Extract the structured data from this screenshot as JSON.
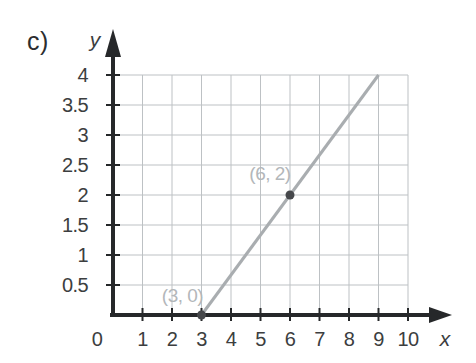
{
  "figure": {
    "label": "c)"
  },
  "chart_data": {
    "type": "line",
    "title": "",
    "xlabel": "x",
    "ylabel": "y",
    "xlim": [
      0,
      10
    ],
    "ylim": [
      0,
      4
    ],
    "x_ticks": [
      1,
      2,
      3,
      4,
      5,
      6,
      7,
      8,
      9,
      10
    ],
    "x_tick_labels": [
      "1",
      "2",
      "3",
      "4",
      "5",
      "6",
      "7",
      "8",
      "9",
      "10"
    ],
    "y_ticks": [
      0.5,
      1,
      1.5,
      2,
      2.5,
      3,
      3.5,
      4
    ],
    "y_tick_labels": [
      "0.5",
      "1",
      "1.5",
      "2",
      "2.5",
      "3",
      "3.5",
      "4"
    ],
    "origin_label": "0",
    "grid": true,
    "legend_position": "none",
    "series": [
      {
        "name": "line",
        "points": [
          [
            3,
            0
          ],
          [
            9,
            4
          ]
        ]
      }
    ],
    "marked_points": [
      {
        "x": 3,
        "y": 0,
        "label": "(3, 0)",
        "label_offset": [
          -19,
          -13
        ]
      },
      {
        "x": 6,
        "y": 2,
        "label": "(6, 2)",
        "label_offset": [
          -20,
          -15
        ]
      }
    ],
    "colors": {
      "background": "#ffffff",
      "axis": "#26282a",
      "grid": "#bdc1c4",
      "line": "#a9adb0",
      "point": "#46484b",
      "point_label": "#b3b7ba",
      "tick_label": "#3c3e40"
    }
  }
}
